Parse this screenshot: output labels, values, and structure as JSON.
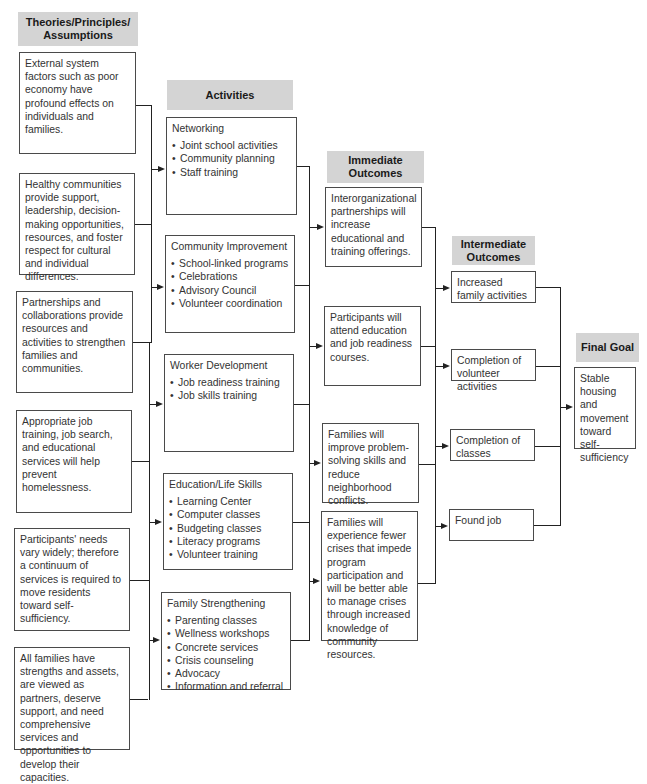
{
  "columns": {
    "theories": {
      "header": "Theories/Principles/ Assumptions",
      "items": [
        "External system factors such as poor economy have profound effects on individuals and families.",
        "Healthy communities provide support, leadership, decision-making opportunities, resources, and foster respect for cultural and individual differences.",
        "Partnerships and collaborations provide resources and activities to strengthen families and communities.",
        "Appropriate job training, job search, and educational services will help prevent homelessness.",
        "Participants' needs vary widely; therefore a continuum of services is required to move residents toward self-sufficiency.",
        "All families have strengths and assets, are viewed as partners, deserve support, and need comprehensive services and opportunities to develop their capacities."
      ]
    },
    "activities": {
      "header": "Activities",
      "items": [
        {
          "title": "Networking",
          "bullets": [
            "Joint school activities",
            "Community planning",
            "Staff training"
          ]
        },
        {
          "title": "Community Improvement",
          "bullets": [
            "School-linked programs",
            "Celebrations",
            "Advisory Council",
            "Volunteer coordination"
          ]
        },
        {
          "title": "Worker Development",
          "bullets": [
            "Job readiness training",
            "Job skills training"
          ]
        },
        {
          "title": "Education/Life Skills",
          "bullets": [
            "Learning Center",
            "Computer classes",
            "Budgeting classes",
            "Literacy programs",
            "Volunteer training"
          ]
        },
        {
          "title": "Family Strengthening",
          "bullets": [
            "Parenting classes",
            "Wellness workshops",
            "Concrete services",
            "Crisis counseling",
            "Advocacy",
            "Information and referral"
          ]
        }
      ]
    },
    "immediate": {
      "header": "Immediate Outcomes",
      "items": [
        "Interorganizational partnerships will increase educational and training offerings.",
        "Participants will attend education and job readiness courses.",
        "Families will improve problem-solving skills and reduce neighborhood conflicts.",
        "Families will experience fewer crises that impede program participation and will be better able to manage crises through increased knowledge of community resources."
      ]
    },
    "intermediate": {
      "header": "Intermediate Outcomes",
      "items": [
        "Increased family activities",
        "Completion of volunteer activities",
        "Completion of classes",
        "Found job"
      ]
    },
    "final": {
      "header": "Final Goal",
      "items": [
        "Stable housing and movement toward self-sufficiency"
      ]
    }
  },
  "colors": {
    "header_fill": "#d4d4d4",
    "border": "#4a4a4a",
    "connector": "#222222"
  }
}
